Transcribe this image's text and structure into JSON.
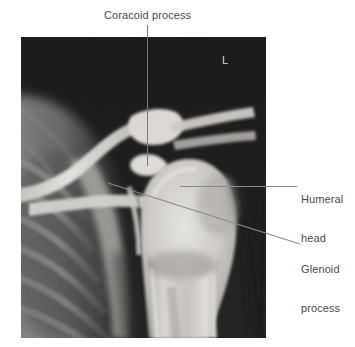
{
  "figure": {
    "kind": "radiograph",
    "modality_marker": "L",
    "region": "shoulder"
  },
  "annotations": [
    {
      "id": "coracoid",
      "label": "Coracoid process",
      "leader": "vertical",
      "icon": "leader-line-icon"
    },
    {
      "id": "humeral-head",
      "label_line_1": "Humeral",
      "label_line_2": "head",
      "leader": "horizontal",
      "icon": "leader-line-icon"
    },
    {
      "id": "glenoid",
      "label_line_1": "Glenoid",
      "label_line_2": "process",
      "leader": "diagonal",
      "icon": "leader-line-icon"
    }
  ],
  "colors": {
    "background": "#ffffff",
    "label_text": "#4a4a4a",
    "leader_line": "#7a7a7a",
    "film_dark": "#1b1b1b",
    "bone_bright": "#e8e6e2",
    "marker_text": "#d8d8d8"
  }
}
